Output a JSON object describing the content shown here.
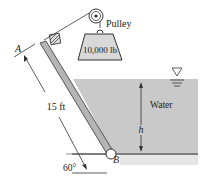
{
  "figure": {
    "labels": {
      "pulley": "Pulley",
      "weight": "10,000 lb",
      "water": "Water",
      "depth": "h",
      "gate_length": "15 ft",
      "angle": "60°",
      "point_top": "A",
      "point_hinge": "B"
    },
    "colors": {
      "water": "#c9c9c9",
      "water_shadow": "#e2e2e2",
      "gate": "#b5b5b5",
      "line": "#333333",
      "weight_fill": "#d8d8d8"
    }
  }
}
